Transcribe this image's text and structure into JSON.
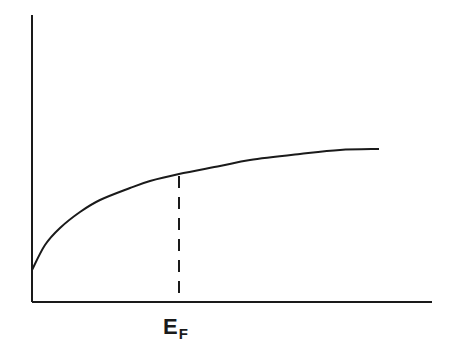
{
  "diagram": {
    "type": "line",
    "title": "",
    "axes": {
      "x_label": "",
      "y_label": "",
      "ticks": "none"
    },
    "curve": {
      "description": "monotonically increasing concave curve starting above origin and flattening toward the right",
      "points_px": [
        [
          32,
          270
        ],
        [
          45,
          245
        ],
        [
          60,
          228
        ],
        [
          80,
          212
        ],
        [
          100,
          200
        ],
        [
          130,
          188
        ],
        [
          150,
          181
        ],
        [
          179,
          174
        ],
        [
          220,
          166
        ],
        [
          250,
          160
        ],
        [
          300,
          154
        ],
        [
          340,
          150
        ],
        [
          379,
          149
        ]
      ]
    },
    "marker": {
      "label_main": "E",
      "label_sub": "F",
      "x_px": 179,
      "style": "dashed vertical line from curve to x-axis"
    },
    "colors": {
      "line": "#1a1a1a",
      "background": "#ffffff"
    }
  }
}
